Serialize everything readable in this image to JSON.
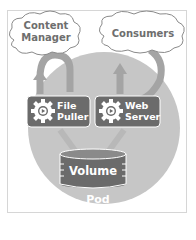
{
  "diagram": {
    "clouds": [
      {
        "id": "content-manager",
        "label_line1": "Content",
        "label_line2": "Manager"
      },
      {
        "id": "consumers",
        "label": "Consumers"
      }
    ],
    "pod": {
      "label": "Pod"
    },
    "containers": [
      {
        "id": "file-puller",
        "label_line1": "File",
        "label_line2": "Puller",
        "icon": "gear-play-icon"
      },
      {
        "id": "web-server",
        "label_line1": "Web",
        "label_line2": "Server",
        "icon": "gear-play-icon"
      }
    ],
    "volume": {
      "label": "Volume"
    },
    "colors": {
      "pod_fill": "#c4c4c4",
      "container_fill": "#6b6b6b",
      "volume_fill": "#6b6b6b",
      "arrow_fill": "#9e9e9e",
      "cloud_stroke": "#8a8a8a",
      "text_light": "#ffffff",
      "cloud_text": "#6e6e6e"
    }
  }
}
